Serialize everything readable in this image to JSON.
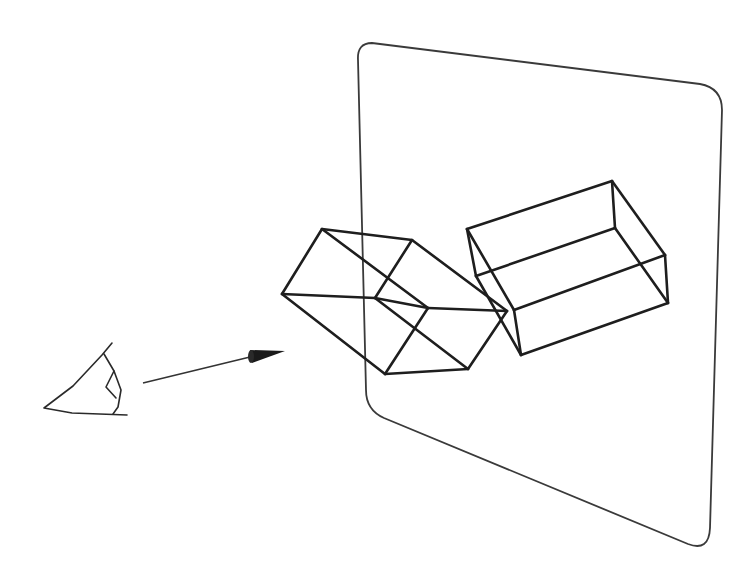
{
  "diagram": {
    "colors": {
      "background": "#ffffff",
      "lines": "#1e1e1e",
      "panel": "#3a3a3a",
      "arrowhead": "#1a1a1a"
    },
    "projection_plane": {
      "path": "M 358 60 Q 357 43 372 43 L 700 84 Q 722 88 722 110 L 710 528 Q 709 552 688 544 L 384 418 Q 366 410 366 390 Z"
    },
    "eye": {
      "outline": [
        [
          112,
          343
        ],
        [
          102,
          355
        ],
        [
          73,
          386
        ],
        [
          44,
          408
        ],
        [
          72,
          413
        ],
        [
          127,
          415
        ]
      ],
      "lid": [
        [
          104,
          354
        ],
        [
          114,
          371
        ],
        [
          106,
          387
        ],
        [
          116,
          398
        ]
      ],
      "iris": [
        [
          114,
          371
        ],
        [
          121,
          390
        ],
        [
          118,
          407
        ],
        [
          113,
          414
        ]
      ]
    },
    "view_ray": {
      "start": [
        143,
        383
      ],
      "end": [
        250,
        357
      ],
      "arrowhead": {
        "base_top": [
          250,
          350
        ],
        "base_bottom": [
          252,
          363
        ],
        "tip": [
          285,
          351
        ]
      }
    },
    "object_box": {
      "vertices": {
        "a": [
          322,
          229
        ],
        "b": [
          412,
          240
        ],
        "c": [
          507,
          311
        ],
        "d": [
          468,
          369
        ],
        "e": [
          385,
          374
        ],
        "f": [
          282,
          294
        ],
        "g": [
          375,
          298
        ],
        "h": [
          428,
          308
        ]
      },
      "edges": [
        [
          "a",
          "b"
        ],
        [
          "b",
          "c"
        ],
        [
          "c",
          "d"
        ],
        [
          "d",
          "e"
        ],
        [
          "e",
          "f"
        ],
        [
          "f",
          "a"
        ],
        [
          "a",
          "h"
        ],
        [
          "h",
          "c"
        ],
        [
          "f",
          "g"
        ],
        [
          "g",
          "d"
        ],
        [
          "b",
          "g"
        ],
        [
          "h",
          "e"
        ],
        [
          "g",
          "h"
        ]
      ]
    },
    "projected_box": {
      "vertices": {
        "a": [
          467,
          229
        ],
        "b": [
          612,
          181
        ],
        "c": [
          665,
          255
        ],
        "d": [
          668,
          303
        ],
        "e": [
          521,
          355
        ],
        "f": [
          476,
          276
        ],
        "g": [
          615,
          228
        ],
        "h": [
          514,
          310
        ]
      },
      "edges": [
        [
          "a",
          "b"
        ],
        [
          "b",
          "c"
        ],
        [
          "c",
          "d"
        ],
        [
          "d",
          "e"
        ],
        [
          "e",
          "h"
        ],
        [
          "h",
          "a"
        ],
        [
          "a",
          "f"
        ],
        [
          "f",
          "g"
        ],
        [
          "g",
          "b"
        ],
        [
          "g",
          "d"
        ],
        [
          "f",
          "e"
        ],
        [
          "h",
          "c"
        ]
      ]
    }
  }
}
